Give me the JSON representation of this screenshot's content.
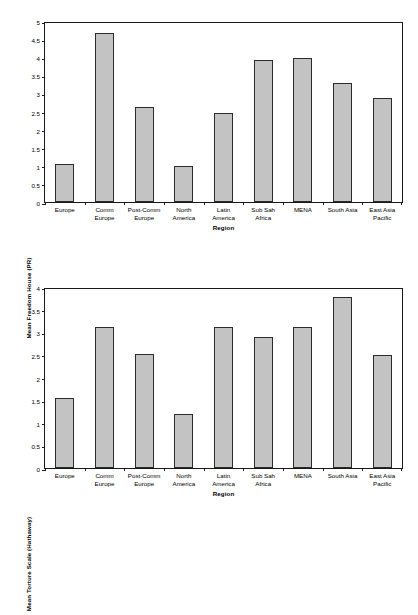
{
  "chart_data": [
    {
      "id": "freedom-house",
      "type": "bar",
      "title": "",
      "xlabel": "Region",
      "ylabel": "Mean Freedom House (PR)",
      "ylim": [
        0,
        5
      ],
      "ytick_step": 0.5,
      "yticks": [
        "5",
        "4.5",
        "4",
        "3.5",
        "3",
        "2.5",
        "2",
        "1.5",
        "1",
        "0.5",
        "0"
      ],
      "grid": false,
      "legend": "none",
      "categories": [
        "Europe",
        "Comm\nEurope",
        "Post-Comm\nEurope",
        "North\nAmerica",
        "Latin\nAmerica",
        "Sub Sah\nAfrica",
        "MENA",
        "South Asia",
        "East Asia\nPacific"
      ],
      "values": [
        1.05,
        4.68,
        2.63,
        0.99,
        2.46,
        3.91,
        3.99,
        3.28,
        2.88
      ]
    },
    {
      "id": "torture-scale",
      "type": "bar",
      "title": "",
      "xlabel": "Region",
      "ylabel": "Mean Torture Scale (Hathaway)",
      "ylim": [
        0,
        4
      ],
      "ytick_step": 0.5,
      "yticks": [
        "4",
        "3.5",
        "3",
        "2.5",
        "2",
        "1.5",
        "1",
        "0.5",
        "0"
      ],
      "grid": false,
      "legend": "none",
      "categories": [
        "Europe",
        "Comm\nEurope",
        "Post-Comm\nEurope",
        "North\nAmerica",
        "Latin\nAmerica",
        "Sub Sah\nAfrica",
        "MENA",
        "South Asia",
        "East Asia\nPacific"
      ],
      "values": [
        1.54,
        3.11,
        2.52,
        1.2,
        3.12,
        2.9,
        3.11,
        3.77,
        2.5
      ]
    }
  ],
  "colors": {
    "bar_fill": "#c3c3c3",
    "bar_border": "#2b2b2b",
    "axis": "#1a1a1a",
    "background": "#ffffff",
    "text": "#000000"
  }
}
